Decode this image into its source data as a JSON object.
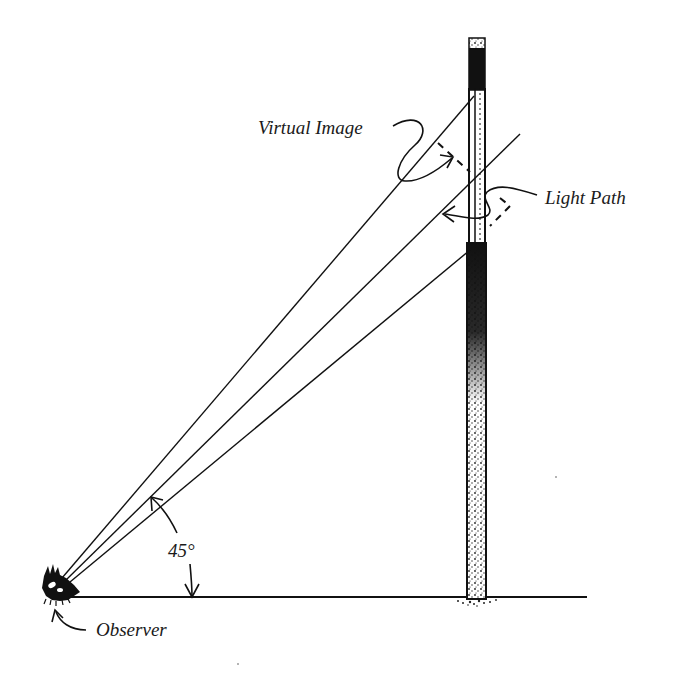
{
  "diagram": {
    "type": "optics-illustration",
    "labels": {
      "virtual_image": "Virtual Image",
      "light_path": "Light Path",
      "angle": "45°",
      "observer": "Observer"
    },
    "colors": {
      "ink": "#111111",
      "background": "#ffffff"
    },
    "elements": [
      "observer (eye) at ground level, left",
      "ground line",
      "vertical pole with reflective slit section",
      "three sight lines from observer to pole",
      "45° angle arc between ground and lower sight line",
      "dashed virtual-image reflection path",
      "curved pointer arrows to labels"
    ]
  }
}
